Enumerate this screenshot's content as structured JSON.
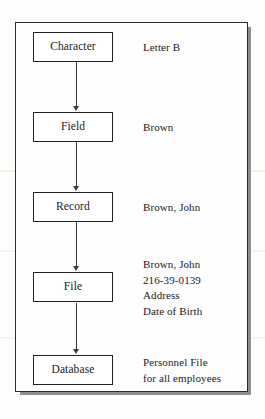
{
  "diagram": {
    "frame_color": "#2b2b2b",
    "shadow_color": "#8e8e8e",
    "page_background": "#fdfdfc",
    "nodes": [
      {
        "label": "Character",
        "example": "Letter B"
      },
      {
        "label": "Field",
        "example": "Brown"
      },
      {
        "label": "Record",
        "example": "Brown, John"
      },
      {
        "label": "File",
        "example": "Brown, John\n216-39-0139\nAddress\nDate of Birth"
      },
      {
        "label": "Database",
        "example": "Personnel File\nfor all employees"
      }
    ],
    "connectors": [
      {
        "from": "Character",
        "to": "Field"
      },
      {
        "from": "Field",
        "to": "Record"
      },
      {
        "from": "Record",
        "to": "File"
      },
      {
        "from": "File",
        "to": "Database"
      }
    ]
  }
}
